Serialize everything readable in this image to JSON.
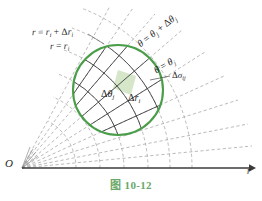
{
  "figure": {
    "caption_label": "图",
    "caption_number": "10-12",
    "caption_full": "图 10-12",
    "caption_color": "#6aa86a",
    "background_color": "#ffffff",
    "circle_color": "#4a9e4a",
    "grid_color": "#3a3a3a",
    "dashed_color": "#9a9a9a",
    "axis_color": "#3a3a3a",
    "shaded_cell_color": "#cfe3c0"
  },
  "labels": {
    "r_outer": {
      "lhs": "r",
      "eq": " = ",
      "base": "r",
      "base_sub": "i",
      "plus": " + ",
      "delta": "Δ",
      "d_base": "r",
      "d_sub": "i"
    },
    "r_inner": {
      "lhs": "r",
      "eq": " = ",
      "base": "r",
      "base_sub": "i"
    },
    "theta_outer": {
      "lhs": "θ",
      "eq": " = ",
      "base": "θ",
      "base_sub": "j",
      "plus": " + ",
      "delta": "Δ",
      "d_base": "θ",
      "d_sub": "j"
    },
    "theta_inner": {
      "lhs": "θ",
      "eq": " = ",
      "base": "θ",
      "base_sub": "j"
    },
    "delta_theta": {
      "delta": "Δ",
      "base": "θ",
      "sub": "j"
    },
    "delta_r": {
      "delta": "Δ",
      "base": "r",
      "sub": "i"
    },
    "delta_sigma": {
      "delta": "Δ",
      "base": "σ",
      "sub": "ij"
    },
    "origin": "O",
    "axis_r": "r"
  },
  "geometry": {
    "origin_x": 22,
    "origin_y": 168,
    "circle_center_x": 118,
    "circle_center_y": 90,
    "circle_radius": 46,
    "axis_start_x": 22,
    "axis_end_x": 252,
    "axis_y": 168,
    "ray_count": 8,
    "arc_count": 6
  }
}
